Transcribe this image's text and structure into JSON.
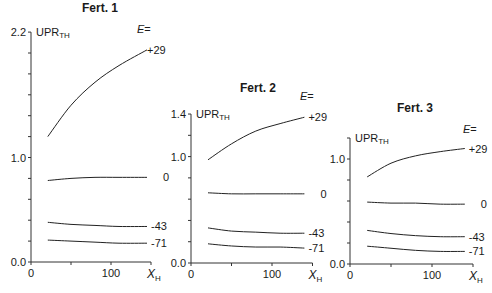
{
  "chart_data": [
    {
      "type": "line",
      "title": "Fert. 1",
      "ylabel": "UPR",
      "ylabel_sub": "TH",
      "xlabel": "X",
      "xlabel_sub": "H",
      "legend_title": "E=",
      "ylim": [
        0.0,
        2.2
      ],
      "xlim": [
        0,
        150
      ],
      "yticks_labeled": [
        "0.0",
        "1.0",
        "2.2"
      ],
      "xticks_labeled": [
        "0",
        "100"
      ],
      "ytick_step": 0.2,
      "xtick_step": 50,
      "x": [
        21,
        50,
        80,
        110,
        145
      ],
      "series": [
        {
          "name": "+29",
          "values": [
            1.2,
            1.5,
            1.72,
            1.88,
            2.03
          ]
        },
        {
          "name": "0",
          "values": [
            0.78,
            0.8,
            0.81,
            0.81,
            0.81
          ]
        },
        {
          "name": "-43",
          "values": [
            0.38,
            0.36,
            0.35,
            0.34,
            0.34
          ]
        },
        {
          "name": "-71",
          "values": [
            0.21,
            0.2,
            0.19,
            0.18,
            0.18
          ]
        }
      ]
    },
    {
      "type": "line",
      "title": "Fert. 2",
      "ylabel": "UPR",
      "ylabel_sub": "TH",
      "xlabel": "X",
      "xlabel_sub": "H",
      "legend_title": "E=",
      "ylim": [
        0.0,
        1.4
      ],
      "xlim": [
        0,
        150
      ],
      "yticks_labeled": [
        "0.0",
        "1.0",
        "1.4"
      ],
      "xticks_labeled": [
        "0",
        "100"
      ],
      "ytick_step": 0.2,
      "xtick_step": 50,
      "x": [
        21,
        50,
        80,
        110,
        140
      ],
      "series": [
        {
          "name": "+29",
          "values": [
            0.97,
            1.12,
            1.24,
            1.31,
            1.37
          ]
        },
        {
          "name": "0",
          "values": [
            0.66,
            0.65,
            0.65,
            0.65,
            0.65
          ]
        },
        {
          "name": "-43",
          "values": [
            0.33,
            0.3,
            0.29,
            0.28,
            0.28
          ]
        },
        {
          "name": "-71",
          "values": [
            0.18,
            0.16,
            0.15,
            0.15,
            0.14
          ]
        }
      ]
    },
    {
      "type": "line",
      "title": "Fert. 3",
      "ylabel": "UPR",
      "ylabel_sub": "TH",
      "xlabel": "X",
      "xlabel_sub": "H",
      "legend_title": "E=",
      "ylim": [
        0.0,
        1.2
      ],
      "xlim": [
        0,
        150
      ],
      "yticks_labeled": [
        "0.0",
        "1.0"
      ],
      "xticks_labeled": [
        "0",
        "100"
      ],
      "ytick_step": 0.2,
      "xtick_step": 50,
      "x": [
        21,
        50,
        80,
        110,
        140
      ],
      "series": [
        {
          "name": "+29",
          "values": [
            0.83,
            0.96,
            1.03,
            1.07,
            1.1
          ]
        },
        {
          "name": "0",
          "values": [
            0.59,
            0.58,
            0.58,
            0.57,
            0.57
          ]
        },
        {
          "name": "-43",
          "values": [
            0.32,
            0.29,
            0.27,
            0.26,
            0.26
          ]
        },
        {
          "name": "-71",
          "values": [
            0.17,
            0.15,
            0.13,
            0.12,
            0.12
          ]
        }
      ]
    }
  ]
}
